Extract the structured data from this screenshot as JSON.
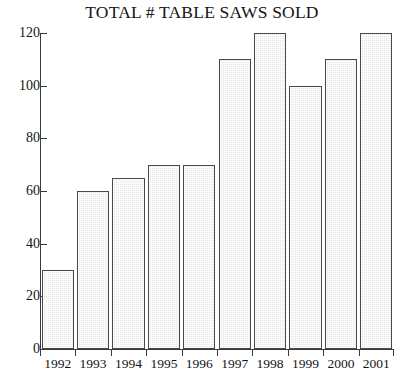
{
  "chart_data": {
    "type": "bar",
    "title": "TOTAL # TABLE SAWS SOLD",
    "xlabel": "",
    "ylabel": "",
    "categories": [
      "1992",
      "1993",
      "1994",
      "1995",
      "1996",
      "1997",
      "1998",
      "1999",
      "2000",
      "2001"
    ],
    "values": [
      30,
      60,
      65,
      70,
      70,
      110,
      120,
      100,
      110,
      120
    ],
    "ylim": [
      0,
      120
    ],
    "ytick_labels": [
      "0",
      "20",
      "40",
      "60",
      "80",
      "100",
      "120"
    ],
    "ytick_values": [
      0,
      20,
      40,
      60,
      80,
      100,
      120
    ],
    "grid": false,
    "legend": null,
    "bar_fill_color": "#e6e6e6",
    "bar_border_color": "#4a4a4a",
    "axis_color": "#3a3a3a",
    "background_color": "#ffffff",
    "text_color": "#141414"
  }
}
